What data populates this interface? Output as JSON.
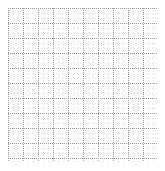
{
  "figure": {
    "kind": "blank-grid",
    "width": 165,
    "height": 171,
    "background_color": "#ffffff",
    "alt_text": ""
  },
  "plot_area": {
    "left": 8,
    "top": 8,
    "width": 149,
    "height": 154
  },
  "chart_data": {
    "type": "scatter",
    "title": "",
    "subtitle": "",
    "xlabel": "",
    "ylabel": "",
    "x": [],
    "y": [],
    "series": [],
    "categories": [],
    "values": [],
    "xtick_labels": [],
    "ytick_labels": [],
    "legend": [],
    "legend_position": "none",
    "annotations": [],
    "grid": true,
    "grid_style": "dotted",
    "grid_minor_spacing_px": 5,
    "grid_major_spacing_px": 15,
    "grid_minor_color": "#dcdcdc",
    "grid_major_color": "#9a9a9a",
    "grid_major_columns": 10,
    "grid_major_rows": 10,
    "grid_minor_columns": 30,
    "grid_minor_rows": 31,
    "axis_line_visible": false,
    "xlim": [
      0,
      10
    ],
    "ylim": [
      0,
      10
    ],
    "data_points_visible": 0
  }
}
